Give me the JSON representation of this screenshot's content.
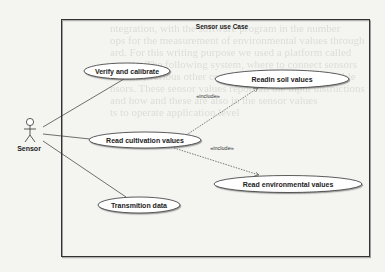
{
  "diagram": {
    "title": "Sensor use Case",
    "actor": {
      "label": "Sensor"
    },
    "use_cases": [
      {
        "id": "verify",
        "label": "Verify and calibrate"
      },
      {
        "id": "soil",
        "label": "Readin soil values"
      },
      {
        "id": "cultivation",
        "label": "Read cultivation values"
      },
      {
        "id": "environmental",
        "label": "Read environmental values"
      },
      {
        "id": "transmit",
        "label": "Transmition data"
      }
    ],
    "relations": [
      {
        "from": "Sensor",
        "to": "verify",
        "type": "association"
      },
      {
        "from": "Sensor",
        "to": "cultivation",
        "type": "association"
      },
      {
        "from": "Sensor",
        "to": "transmit",
        "type": "association"
      },
      {
        "from": "cultivation",
        "to": "soil",
        "type": "include",
        "label": "«include»"
      },
      {
        "from": "cultivation",
        "to": "environmental",
        "type": "include",
        "label": "«include»"
      }
    ]
  }
}
